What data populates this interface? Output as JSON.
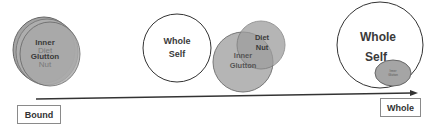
{
  "diagram": {
    "stage1": {
      "circle_labels": [
        "Inner",
        "Diet",
        "Glutton",
        "Nut"
      ],
      "fill": "#a9a9a9"
    },
    "stage2": {
      "whole_self": [
        "Whole",
        "Self"
      ],
      "inner_glutton": [
        "Inner",
        "Glutton"
      ],
      "diet_nut": [
        "Diet",
        "Nut"
      ]
    },
    "stage3": {
      "whole_self": [
        "Whole",
        "Self"
      ],
      "small_ellipse": [
        "Inner",
        "Glutton"
      ]
    },
    "axis": {
      "start_label": "Bound",
      "end_label": "Whole",
      "color": "#333333"
    }
  }
}
